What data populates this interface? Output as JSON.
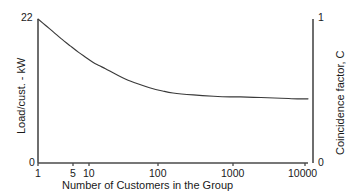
{
  "chart_data": {
    "type": "line",
    "title": "",
    "xlabel": "Number of Customers in the Group",
    "ylabel": "Load/cust. - kW",
    "y2label": "Coincidence factor, C",
    "xscale": "log",
    "xlim": [
      1,
      10000
    ],
    "ylim": [
      0,
      22
    ],
    "y2lim": [
      0,
      1
    ],
    "grid": false,
    "legend": null,
    "xticks": [
      {
        "value": 1,
        "label": "1"
      },
      {
        "value": 5,
        "label": "5"
      },
      {
        "value": 10,
        "label": "10"
      },
      {
        "value": 100,
        "label": "100"
      },
      {
        "value": 1000,
        "label": "1000"
      },
      {
        "value": 10000,
        "label": "10000"
      }
    ],
    "yticks": [
      {
        "value": 22,
        "label": "22"
      },
      {
        "value": 0,
        "label": "0"
      }
    ],
    "y2ticks": [
      {
        "value": 1,
        "label": "1"
      },
      {
        "value": 0,
        "label": "0"
      }
    ],
    "x": [
      1,
      1.3,
      1.7,
      2.2,
      3,
      4,
      5,
      6.5,
      8,
      10,
      14,
      20,
      30,
      45,
      70,
      100,
      200,
      400,
      700,
      1000,
      2000,
      4000,
      7000,
      10000
    ],
    "series": [
      {
        "name": "Coincidence factor",
        "values_kw": [
          22.0,
          21.0,
          20.0,
          19.0,
          17.9,
          16.9,
          16.2,
          15.4,
          14.9,
          14.4,
          13.6,
          12.8,
          12.1,
          11.5,
          11.0,
          10.7,
          10.4,
          10.2,
          10.1,
          10.1,
          10.0,
          9.9,
          9.8,
          9.8
        ],
        "values_c": [
          1.0,
          0.955,
          0.909,
          0.864,
          0.814,
          0.768,
          0.736,
          0.7,
          0.677,
          0.655,
          0.618,
          0.582,
          0.55,
          0.523,
          0.5,
          0.486,
          0.473,
          0.464,
          0.459,
          0.459,
          0.455,
          0.45,
          0.445,
          0.445
        ]
      }
    ]
  },
  "axes": {
    "left_title": "Load/cust. - kW",
    "right_title": "Coincidence factor, C",
    "bottom_title": "Number of Customers in the Group",
    "left_top_tick": "22",
    "left_bottom_tick": "0",
    "right_top_tick": "1",
    "right_bottom_tick": "0",
    "xtick_1": "1",
    "xtick_5": "5",
    "xtick_10": "10",
    "xtick_100": "100",
    "xtick_1000": "1000",
    "xtick_10000": "10000"
  },
  "colors": {
    "curve": "#3a3a3a",
    "axis": "#4a4a4a",
    "text": "#1a1a1a",
    "background": "#ffffff"
  }
}
